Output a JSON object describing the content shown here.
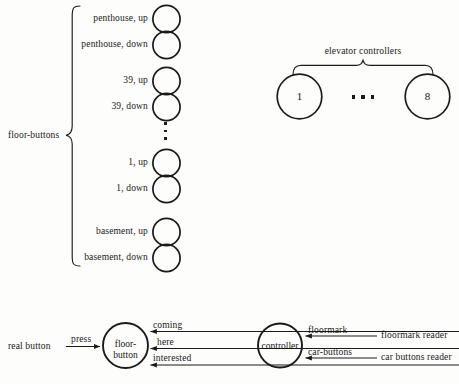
{
  "figure": {
    "title": "",
    "background_color": "#fdfdfb",
    "ink_color": "#1a1a1a"
  },
  "floor_buttons_group": {
    "group_label": "floor-buttons",
    "brace_icon": "left-curly-brace",
    "items": [
      {
        "label": "penthouse, up",
        "circle_label": "",
        "cy": 19
      },
      {
        "label": "penthouse, down",
        "circle_label": "",
        "cy": 45
      },
      {
        "label": "39, up",
        "circle_label": "",
        "cy": 81
      },
      {
        "label": "39, down",
        "circle_label": "",
        "cy": 107
      },
      {
        "label": "1, up",
        "circle_label": "",
        "cy": 163
      },
      {
        "label": "1, down",
        "circle_label": "",
        "cy": 189
      },
      {
        "label": "basement, up",
        "circle_label": "",
        "cy": 232
      },
      {
        "label": "basement, down",
        "circle_label": "",
        "cy": 258
      }
    ],
    "ellipsis_icon": "vertical-ellipsis"
  },
  "elevator_controllers_group": {
    "group_label": "elevator controllers",
    "brace_icon": "top-curly-brace",
    "nodes": [
      {
        "label": "1"
      },
      {
        "label": "8"
      }
    ],
    "ellipsis_icon": "horizontal-ellipsis"
  },
  "state_diagram": {
    "nodes": [
      {
        "id": "floor-button",
        "line1": "floor-",
        "line2": "button"
      },
      {
        "id": "controller",
        "line1": "controller",
        "line2": ""
      }
    ],
    "external": [
      {
        "id": "real-button",
        "label": "real button"
      },
      {
        "id": "floormark-reader",
        "label": "floormark reader"
      },
      {
        "id": "car-buttons-reader",
        "label": "car buttons reader"
      }
    ],
    "edges": [
      {
        "id": "press",
        "label": "press",
        "from": "real button",
        "to": "floor-button"
      },
      {
        "id": "coming",
        "label": "coming",
        "from": "controller",
        "to": "floor-button"
      },
      {
        "id": "here",
        "label": "here",
        "from": "controller",
        "to": "floor-button"
      },
      {
        "id": "interested",
        "label": "interested",
        "from": "controller",
        "to": "floor-button"
      },
      {
        "id": "floormark",
        "label": "floormark",
        "from": "floormark reader",
        "to": "controller"
      },
      {
        "id": "car-buttons",
        "label": "car-buttons",
        "from": "car buttons reader",
        "to": "controller"
      }
    ]
  }
}
